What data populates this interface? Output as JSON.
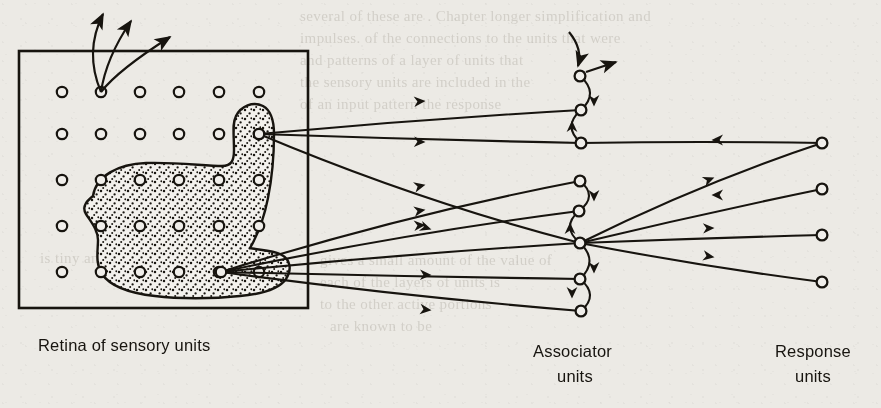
{
  "figure": {
    "type": "neural-network-schematic",
    "background_color": "#eceae5",
    "ink_color": "#17140f"
  },
  "labels": [
    {
      "id": "retina",
      "text": "Retina of sensory units",
      "x": 38,
      "y": 336,
      "align": "left"
    },
    {
      "id": "associator",
      "text": "Associator",
      "x": 533,
      "y": 342,
      "align": "left"
    },
    {
      "id": "associator2",
      "text": "units",
      "x": 557,
      "y": 367,
      "align": "left"
    },
    {
      "id": "response",
      "text": "Response",
      "x": 775,
      "y": 342,
      "align": "left"
    },
    {
      "id": "response2",
      "text": "units",
      "x": 795,
      "y": 367,
      "align": "left"
    }
  ],
  "retina": {
    "box": {
      "x": 19,
      "y": 51,
      "width": 289,
      "height": 257,
      "stroke": "#17140f",
      "stroke_width": 2.6
    },
    "grid": {
      "columns_x": [
        62,
        101,
        140,
        179,
        219,
        259
      ],
      "rows_y": [
        92,
        134,
        180,
        226,
        272
      ],
      "node_radius": 5.2,
      "node_stroke_width": 2.2
    },
    "stimulus_patch": {
      "description": "irregular stippled blob covering part of the retina",
      "fill": "#f2f0ec",
      "stipple": true,
      "path": "M 93 196 C 96 176, 118 164, 146 163 C 176 162, 205 166, 222 166 C 232 166, 234 160, 234 150 C 234 134, 232 124, 236 116 C 241 106, 253 101, 263 106 C 272 111, 274 122, 274 134 C 274 150, 272 178, 268 198 C 264 218, 257 236, 250 248 C 258 250, 272 250, 280 254 C 291 259, 292 270, 286 279 C 279 289, 262 294, 240 296 C 212 299, 178 299, 155 296 C 128 293, 110 286, 102 274 C 95 263, 98 250, 98 240 C 98 230, 91 222, 86 214 C 81 206, 88 200, 93 196 Z"
    },
    "top_source_node": {
      "x": 101,
      "y": 92
    },
    "output_nodes": [
      {
        "id": "r-upper",
        "x": 259,
        "y": 134
      },
      {
        "id": "r-lower",
        "x": 221,
        "y": 272
      }
    ],
    "escape_arrows": [
      {
        "from": [
          101,
          92
        ],
        "to": [
          103,
          14
        ],
        "control": [
          84,
          52
        ]
      },
      {
        "from": [
          101,
          92
        ],
        "to": [
          131,
          21
        ],
        "control": [
          106,
          58
        ]
      },
      {
        "from": [
          101,
          92
        ],
        "to": [
          170,
          37
        ],
        "control": [
          118,
          70
        ]
      }
    ]
  },
  "associator": {
    "node_radius": 5.4,
    "nodes": [
      {
        "id": "a1",
        "x": 580,
        "y": 76
      },
      {
        "id": "a2",
        "x": 581,
        "y": 110
      },
      {
        "id": "a3",
        "x": 581,
        "y": 143
      },
      {
        "id": "a4",
        "x": 580,
        "y": 181
      },
      {
        "id": "a5",
        "x": 579,
        "y": 211
      },
      {
        "id": "a6",
        "x": 580,
        "y": 243
      },
      {
        "id": "a7",
        "x": 580,
        "y": 279
      },
      {
        "id": "a8",
        "x": 581,
        "y": 311
      }
    ],
    "external_input_arrow": {
      "from": [
        569,
        32
      ],
      "to": [
        578,
        66
      ]
    },
    "external_output_arrow": {
      "from": [
        586,
        72
      ],
      "to": [
        616,
        62
      ]
    }
  },
  "response": {
    "node_radius": 5.4,
    "nodes": [
      {
        "id": "p1",
        "x": 822,
        "y": 143
      },
      {
        "id": "p2",
        "x": 822,
        "y": 189
      },
      {
        "id": "p3",
        "x": 822,
        "y": 235
      },
      {
        "id": "p4",
        "x": 822,
        "y": 282
      }
    ]
  },
  "connections": {
    "retina_to_associator": [
      {
        "from": "r-upper",
        "to": "a2",
        "arrow_at": [
          424,
          101
        ]
      },
      {
        "from": "r-upper",
        "to": "a3",
        "arrow_at": [
          424,
          142
        ]
      },
      {
        "from": "r-upper",
        "to": "a6",
        "arrow_at": [
          430,
          229
        ]
      },
      {
        "from": "r-lower",
        "to": "a4",
        "arrow_at": [
          424,
          185
        ]
      },
      {
        "from": "r-lower",
        "to": "a5",
        "arrow_at": [
          424,
          210
        ]
      },
      {
        "from": "r-lower",
        "to": "a6",
        "arrow_at": [
          424,
          225
        ]
      },
      {
        "from": "r-lower",
        "to": "a7",
        "arrow_at": [
          430,
          275
        ]
      },
      {
        "from": "r-lower",
        "to": "a8",
        "arrow_at": [
          430,
          310
        ]
      }
    ],
    "associator_internal": [
      {
        "from": "a1",
        "to": "a2",
        "arrow_at": [
          594,
          105
        ],
        "direction": "down"
      },
      {
        "from": "a3",
        "to": "a2",
        "arrow_at": [
          572,
          122
        ],
        "direction": "up"
      },
      {
        "from": "a4",
        "to": "a5",
        "arrow_at": [
          594,
          200
        ],
        "direction": "down"
      },
      {
        "from": "a6",
        "to": "a5",
        "arrow_at": [
          570,
          224
        ],
        "direction": "up"
      },
      {
        "from": "a6",
        "to": "a7",
        "arrow_at": [
          594,
          272
        ],
        "direction": "down"
      },
      {
        "from": "a7",
        "to": "a8",
        "arrow_at": [
          572,
          297
        ],
        "direction": "down"
      }
    ],
    "response_to_associator": [
      {
        "from": "p1",
        "to": "a3",
        "arrow_at": [
          713,
          140
        ],
        "direction": "left"
      },
      {
        "from": "p2",
        "to": "a6",
        "arrow_at": [
          713,
          195
        ],
        "direction": "left"
      }
    ],
    "associator_to_response": [
      {
        "from": "a6",
        "to": "p1",
        "arrow_at": [
          713,
          178
        ]
      },
      {
        "from": "a6",
        "to": "p3",
        "arrow_at": [
          713,
          228
        ]
      },
      {
        "from": "a6",
        "to": "p4",
        "arrow_at": [
          713,
          257
        ]
      }
    ]
  },
  "ghost_text": [
    {
      "text": "several of these are  . Chapter longer  simplification  and",
      "x": 300,
      "y": 8
    },
    {
      "text": "impulses.  of  the  connections  to  the  units  that  were",
      "x": 300,
      "y": 30
    },
    {
      "text": "and  patterns  of  a  layer  of  units  that",
      "x": 300,
      "y": 52
    },
    {
      "text": "the  sensory  units  are  included  in  the",
      "x": 300,
      "y": 74
    },
    {
      "text": "of  an  input  pattern  the  response",
      "x": 300,
      "y": 96
    },
    {
      "text": "is  tiny  and  also  the  field  and",
      "x": 40,
      "y": 250
    },
    {
      "text": "gives  a  small  amount  of  the  value  of",
      "x": 320,
      "y": 252
    },
    {
      "text": "each  of  the  layers  of  units  is",
      "x": 320,
      "y": 274
    },
    {
      "text": "to  the  other  active  portions",
      "x": 320,
      "y": 296
    },
    {
      "text": "are  known  to  be",
      "x": 330,
      "y": 318
    }
  ]
}
